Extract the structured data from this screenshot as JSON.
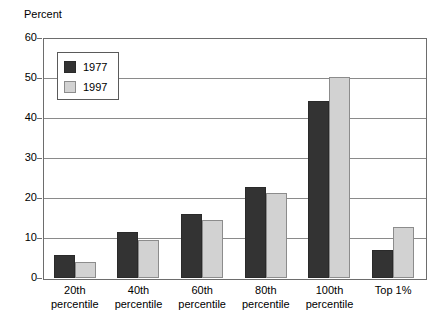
{
  "chart_data": {
    "type": "bar",
    "title": "",
    "subtitle": "",
    "xlabel": "",
    "ylabel": "Percent",
    "ylim": [
      0,
      60
    ],
    "yticks": [
      0,
      10,
      20,
      30,
      40,
      50,
      60
    ],
    "ytick_labels": [
      "0",
      "10",
      "20",
      "30",
      "40",
      "50",
      "60"
    ],
    "grid": "horizontal",
    "legend_position": "upper-left-inside",
    "categories": [
      "20th percentile",
      "40th percentile",
      "60th percentile",
      "80th percentile",
      "100th percentile",
      "Top 1%"
    ],
    "category_lines": [
      [
        "20th",
        "percentile"
      ],
      [
        "40th",
        "percentile"
      ],
      [
        "60th",
        "percentile"
      ],
      [
        "80th",
        "percentile"
      ],
      [
        "100th",
        "percentile"
      ],
      [
        "Top 1%",
        ""
      ]
    ],
    "series": [
      {
        "name": "1977",
        "color": "#333333",
        "values": [
          5.8,
          11.5,
          16.0,
          22.8,
          44.3,
          7.0
        ]
      },
      {
        "name": "1997",
        "color": "#d2d2d2",
        "values": [
          4.0,
          9.5,
          14.5,
          21.3,
          50.2,
          12.7
        ]
      }
    ]
  },
  "legend": {
    "items": [
      {
        "label": "1977",
        "swatch": "dark-square-swatch"
      },
      {
        "label": "1997",
        "swatch": "light-square-swatch"
      }
    ]
  },
  "axis": {
    "y_title": "Percent"
  },
  "colors": {
    "series_1977": "#333333",
    "series_1997": "#d2d2d2",
    "gridline": "#8a8a8a",
    "axis": "#6d6d6d",
    "background": "#ffffff",
    "text": "#000000"
  }
}
